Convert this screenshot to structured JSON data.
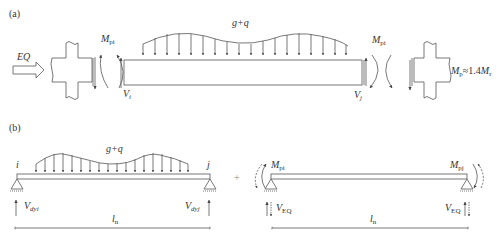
{
  "panel_a": {
    "label": "(a)",
    "earthquake_label": "EQ",
    "load_label": "g+q",
    "moment_left": {
      "symbol": "M",
      "subscript": "pi"
    },
    "moment_right": {
      "symbol": "M",
      "subscript": "pi"
    },
    "shear_left": {
      "symbol": "V",
      "subscript": "i"
    },
    "shear_right": {
      "symbol": "V",
      "subscript": "j"
    },
    "relation": {
      "lhs_symbol": "M",
      "lhs_sub": "p",
      "operator": "≈1.4",
      "rhs_symbol": "M",
      "rhs_sub": "r"
    }
  },
  "panel_b": {
    "label": "(b)",
    "plus_sign": "+",
    "left_beam": {
      "node_left": "i",
      "node_right": "j",
      "load_label": "g+q",
      "shear_left": {
        "symbol": "V",
        "subscript": "dyi"
      },
      "shear_right": {
        "symbol": "V",
        "subscript": "dyj"
      },
      "span": {
        "symbol": "l",
        "subscript": "n"
      }
    },
    "right_beam": {
      "moment_left": {
        "symbol": "M",
        "subscript": "pi"
      },
      "moment_right": {
        "symbol": "M",
        "subscript": "pj"
      },
      "shear_left": {
        "symbol": "V",
        "subscript": "EQ"
      },
      "shear_right": {
        "symbol": "V",
        "subscript": "EQ"
      },
      "span": {
        "symbol": "l",
        "subscript": "n"
      }
    }
  },
  "colors": {
    "line": "#555555",
    "text": "#333333",
    "background": "#ffffff"
  }
}
